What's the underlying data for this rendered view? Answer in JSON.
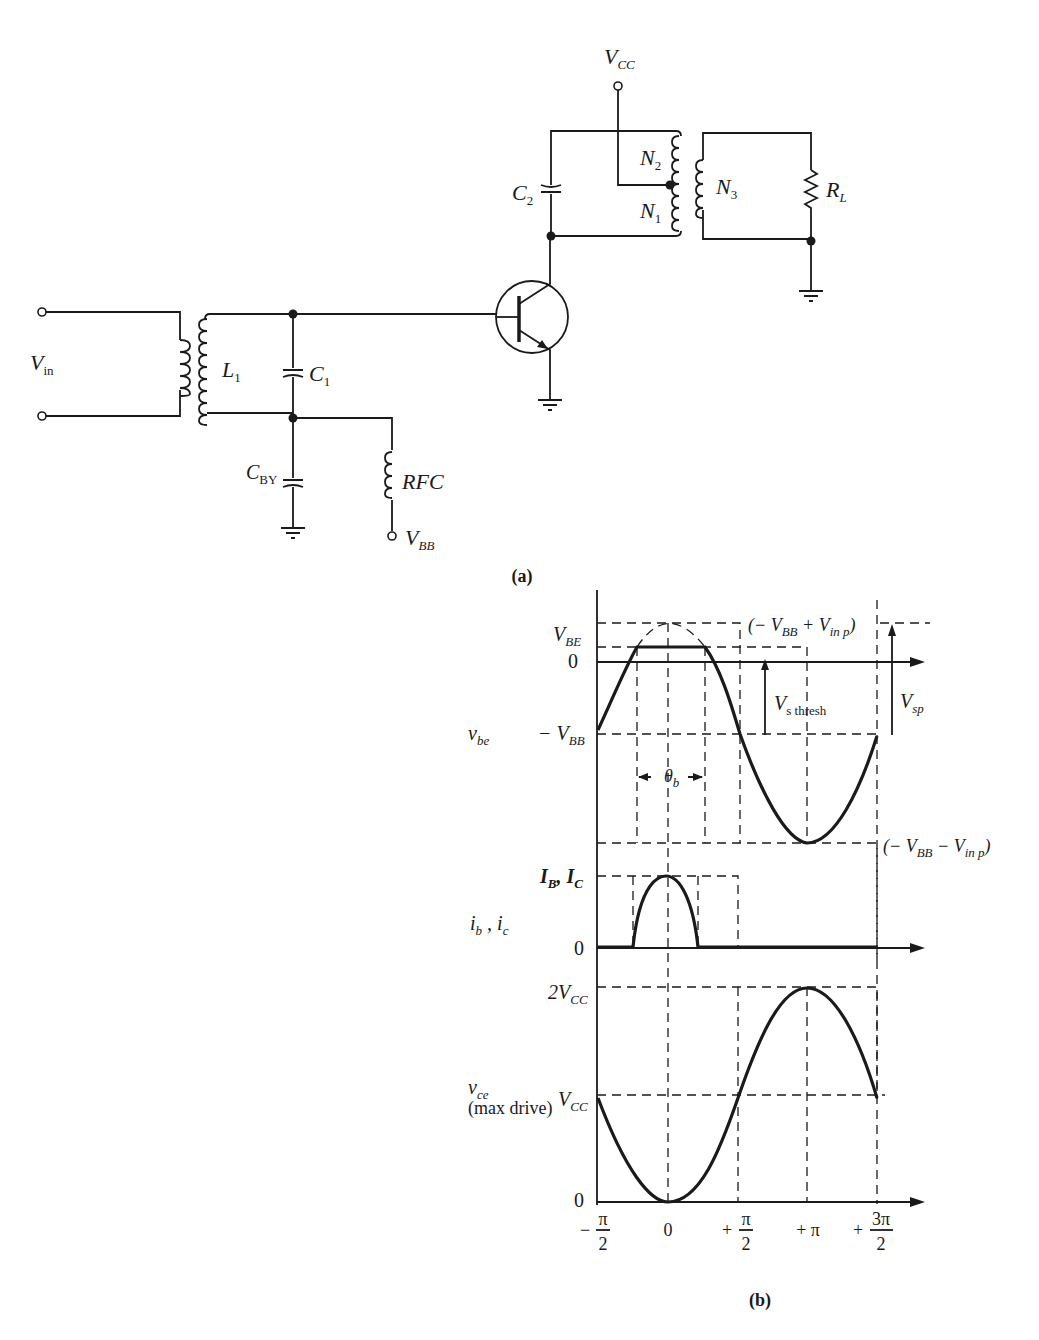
{
  "figure": {
    "part_a_caption": "(a)",
    "part_b_caption": "(b)"
  },
  "circuit": {
    "labels": {
      "vcc": "V",
      "vcc_sub": "CC",
      "vin": "V",
      "vin_sub": "in",
      "l1": "L",
      "l1_sub": "1",
      "c1": "C",
      "c1_sub": "1",
      "c2": "C",
      "c2_sub": "2",
      "cby": "C",
      "cby_sub": "BY",
      "rfc": "RFC",
      "vbb": "V",
      "vbb_sub": "BB",
      "n1": "N",
      "n1_sub": "1",
      "n2": "N",
      "n2_sub": "2",
      "n3": "N",
      "n3_sub": "3",
      "rl": "R",
      "rl_sub": "L"
    },
    "components": [
      "input-transformer",
      "L1",
      "C1",
      "CBY",
      "RFC",
      "NPN-transistor",
      "C2",
      "output-transformer-N1-N2-N3",
      "RL",
      "ground"
    ]
  },
  "waveforms": {
    "vbe": {
      "name": "v",
      "name_sub": "be",
      "y_labels": {
        "vbe": "V",
        "vbe_sub": "BE",
        "zero": "0",
        "neg_vbb": "− V",
        "neg_vbb_sub": "BB"
      },
      "annotations": {
        "top": "(− V",
        "top_sub1": "BB",
        "top_mid": " + V",
        "top_sub2": "in p",
        "top_end": ")",
        "bottom": "(− V",
        "bottom_sub1": "BB",
        "bottom_mid": " − V",
        "bottom_sub2": "in p",
        "bottom_end": ")",
        "vs_thresh": "V",
        "vs_thresh_sub": "s thresh",
        "vsp": "V",
        "vsp_sub": "sp",
        "theta_b": "θ",
        "theta_b_sub": "b"
      }
    },
    "ibic": {
      "name": "i",
      "name_sub1": "b",
      "name_mid": " , i",
      "name_sub2": "c",
      "y_labels": {
        "peak": "I",
        "peak_sub1": "B",
        "peak_mid": ", I",
        "peak_sub2": "C",
        "zero": "0"
      }
    },
    "vce": {
      "name": "v",
      "name_sub": "ce",
      "name_note": "(max drive)",
      "y_labels": {
        "two_vcc": "2V",
        "two_vcc_sub": "CC",
        "vcc": "V",
        "vcc_sub": "CC",
        "zero": "0"
      }
    },
    "x_ticks": [
      {
        "sign": "−",
        "num": "π",
        "den": "2"
      },
      {
        "label": "0"
      },
      {
        "sign": "+",
        "num": "π",
        "den": "2"
      },
      {
        "label": "+ π"
      },
      {
        "sign": "+",
        "num": "3π",
        "den": "2"
      }
    ]
  }
}
